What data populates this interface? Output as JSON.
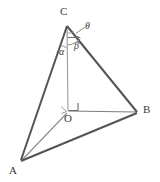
{
  "figure": {
    "kind": "geometry-diagram",
    "background_color": "#ffffff",
    "stroke_color": "#4a4a4a",
    "thin_stroke_color": "#8c8c8c",
    "label_color": "#3a3a3a"
  },
  "vertices": [
    {
      "id": "C",
      "label": "C",
      "x": 67,
      "y": 25,
      "label_x": 61,
      "label_y": 8
    },
    {
      "id": "B",
      "label": "B",
      "x": 137,
      "y": 112,
      "label_x": 143,
      "label_y": 107
    },
    {
      "id": "A",
      "label": "A",
      "x": 21,
      "y": 161,
      "label_x": 10,
      "label_y": 166
    },
    {
      "id": "O",
      "label": "O",
      "x": 68,
      "y": 112,
      "label_x": 65,
      "label_y": 115
    }
  ],
  "angle_labels": [
    {
      "id": "theta",
      "label": "θ",
      "x": 86,
      "y": 23
    },
    {
      "id": "beta",
      "label": "β",
      "x": 76,
      "y": 44
    },
    {
      "id": "alpha",
      "label": "α",
      "x": 61,
      "y": 49
    }
  ],
  "edges": [
    {
      "id": "edge-CA",
      "from": "C",
      "to": "A",
      "style": "solid-thick"
    },
    {
      "id": "edge-CB",
      "from": "C",
      "to": "B",
      "style": "solid-thick"
    },
    {
      "id": "edge-AB",
      "from": "A",
      "to": "B",
      "style": "solid-thick"
    },
    {
      "id": "edge-CO",
      "from": "C",
      "to": "O",
      "style": "solid-thin"
    },
    {
      "id": "edge-OB",
      "from": "O",
      "to": "B",
      "style": "solid-thin"
    },
    {
      "id": "edge-OA",
      "from": "O",
      "to": "A",
      "style": "solid-thin"
    }
  ],
  "markers": [
    {
      "id": "right-angle-at-O-vertical",
      "type": "right-angle-square"
    },
    {
      "id": "right-angle-at-O-base",
      "type": "right-angle-tick"
    },
    {
      "id": "theta-leader",
      "type": "leader-line-with-arrow"
    },
    {
      "id": "beta-arc",
      "type": "angle-arc"
    },
    {
      "id": "alpha-arc",
      "type": "angle-arc"
    }
  ]
}
